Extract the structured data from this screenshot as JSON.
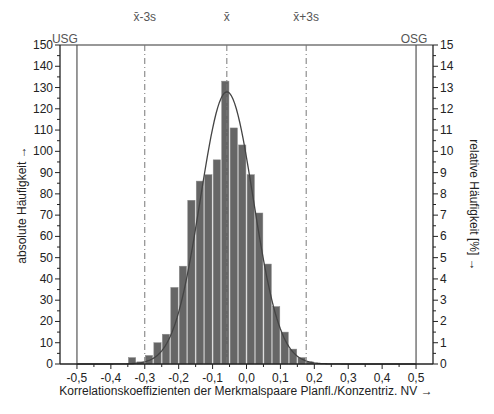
{
  "chart_data": {
    "type": "bar",
    "title": "",
    "xlabel": "Korrelationskoeffizienten der Merkmalspaare Planfl./Konzentriz.  NV →",
    "ylabel": "absolute Häufigkeit →",
    "ylabel_right": "relative Häufigkeit [%] →",
    "xlim": [
      -0.55,
      0.55
    ],
    "ylim": [
      0,
      150
    ],
    "ylim_right": [
      0,
      15
    ],
    "x_ticks": [
      "-0,5",
      "-0,4",
      "-0,3",
      "-0,2",
      "-0,1",
      "0,0",
      "0,1",
      "0,2",
      "0,3",
      "0,4",
      "0,5"
    ],
    "x_tick_values": [
      -0.5,
      -0.4,
      -0.3,
      -0.2,
      -0.1,
      0.0,
      0.1,
      0.2,
      0.3,
      0.4,
      0.5
    ],
    "y_ticks": [
      0,
      10,
      20,
      30,
      40,
      50,
      60,
      70,
      80,
      90,
      100,
      110,
      120,
      130,
      140,
      150
    ],
    "y_ticks_right": [
      0,
      1,
      2,
      3,
      4,
      5,
      6,
      7,
      8,
      9,
      10,
      11,
      12,
      13,
      14,
      15
    ],
    "bin_width": 0.025,
    "bins": [
      -0.3375,
      -0.3125,
      -0.2875,
      -0.2625,
      -0.2375,
      -0.2125,
      -0.1875,
      -0.1625,
      -0.1375,
      -0.1125,
      -0.0875,
      -0.0625,
      -0.0375,
      -0.0125,
      0.0125,
      0.0375,
      0.0625,
      0.0875,
      0.1125,
      0.1375,
      0.1625,
      0.1875
    ],
    "values": [
      3,
      1,
      4,
      10,
      14,
      36,
      46,
      77,
      86,
      89,
      96,
      133,
      111,
      103,
      89,
      71,
      47,
      27,
      15,
      7,
      3,
      1
    ],
    "bar_color": "#666666",
    "normal_curve": {
      "mean": -0.058,
      "sd": 0.078,
      "peak": 128,
      "color": "#444444"
    },
    "reference_lines": [
      {
        "label": "USG",
        "x": -0.5,
        "style": "solid"
      },
      {
        "label": "OSG",
        "x": 0.5,
        "style": "solid"
      },
      {
        "label": "x̄-3s",
        "x": -0.3,
        "style": "dashdot"
      },
      {
        "label": "x̄",
        "x": -0.058,
        "style": "dashdot"
      },
      {
        "label": "x̄+3s",
        "x": 0.176,
        "style": "dashdot"
      }
    ],
    "grid": false,
    "legend": "none"
  }
}
